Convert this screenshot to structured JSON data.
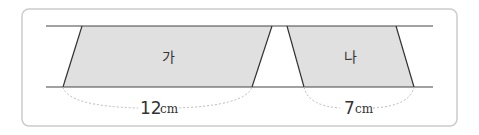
{
  "colors": {
    "frame": "#c8c8c8",
    "line": "#3a3a3a",
    "fill": "#e0e0e0",
    "dotted": "#bbbbbb"
  },
  "shapes": [
    {
      "name": "가",
      "base": "12",
      "unit": "cm"
    },
    {
      "name": "나",
      "base": "7",
      "unit": "cm"
    }
  ]
}
